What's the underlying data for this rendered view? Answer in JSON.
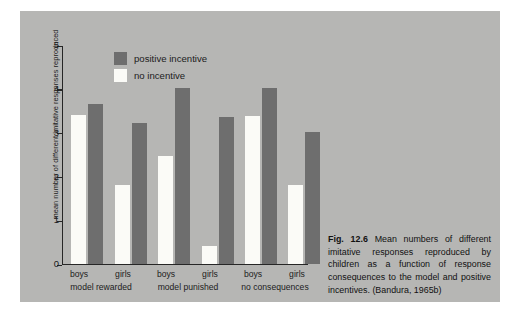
{
  "figure": {
    "caption_label": "Fig. 12.6",
    "caption_text": " Mean numbers of different imitative responses reproduced by children as a function of response consequences to the model and positive incentives. (Bandura, 1965b)"
  },
  "colors": {
    "panel_background": "#b6b6b4",
    "page_background": "#ffffff",
    "dark_bar": "#6e6e6e",
    "light_bar": "#fbfbf7",
    "axis": "#262626",
    "text": "#1c1c1c"
  },
  "chart_data": {
    "type": "bar",
    "title": "",
    "xlabel": "",
    "ylabel": "mean number of different imitative responses reproduced",
    "ylim": [
      0,
      5
    ],
    "yticks": [
      0,
      1,
      2,
      3,
      4,
      5
    ],
    "ytick_labels": [
      "0",
      "1",
      "2",
      "3",
      "4",
      "5"
    ],
    "grid": false,
    "legend_position": "top-center",
    "categories": [
      "boys",
      "girls",
      "boys",
      "girls",
      "boys",
      "girls"
    ],
    "groups": [
      {
        "label": "model rewarded",
        "categories": [
          "boys",
          "girls"
        ]
      },
      {
        "label": "model punished",
        "categories": [
          "boys",
          "girls"
        ]
      },
      {
        "label": "no consequences",
        "categories": [
          "boys",
          "girls"
        ]
      }
    ],
    "series": [
      {
        "name": "no incentive",
        "color": "#fbfbf7",
        "values": [
          3.4,
          1.8,
          2.45,
          0.4,
          3.38,
          1.8
        ]
      },
      {
        "name": "positive incentive",
        "color": "#6e6e6e",
        "values": [
          3.65,
          3.2,
          4.0,
          3.35,
          4.0,
          3.0
        ]
      }
    ],
    "legend": [
      {
        "label": "positive incentive",
        "swatch": "#6e6e6e"
      },
      {
        "label": "no incentive",
        "swatch": "#fbfbf7"
      }
    ]
  }
}
